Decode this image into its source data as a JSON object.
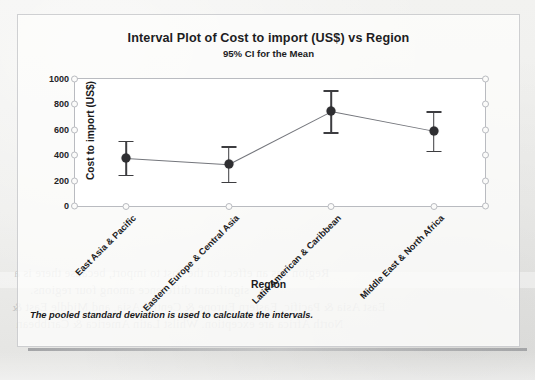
{
  "figure": {
    "title": "Interval Plot of Cost to import (US$) vs Region",
    "subtitle": "95% CI for the Mean",
    "footnote": "The pooled standard deviation is used to calculate the intervals."
  },
  "background_text": {
    "line1": "Region has an effect on the cost to import, because there is a",
    "line2": "significant difference among four regions.",
    "line3": "East Asia & Pacific, Eastern Europe & Central Asia, and Middle East &",
    "line4": "North Africa are exception. Whilst Latin America & Caribbean"
  },
  "chart_data": {
    "type": "line",
    "title": "Interval Plot of Cost to import (US$) vs Region",
    "subtitle": "95% CI for the Mean",
    "xlabel": "Region",
    "ylabel": "Cost to import (US$)",
    "ylim": [
      0,
      1000
    ],
    "yticks": [
      0,
      200,
      400,
      600,
      800,
      1000
    ],
    "grid": false,
    "legend": "none",
    "categories": [
      "East Asia & Pacific",
      "Eastern Europe & Central Asia",
      "Latin American & Caribbean",
      "Middle East & North Africa"
    ],
    "series": [
      {
        "name": "Mean",
        "values": [
          380,
          330,
          745,
          590
        ],
        "ci_upper": [
          515,
          470,
          910,
          745
        ],
        "ci_lower": [
          245,
          190,
          580,
          435
        ]
      }
    ]
  }
}
